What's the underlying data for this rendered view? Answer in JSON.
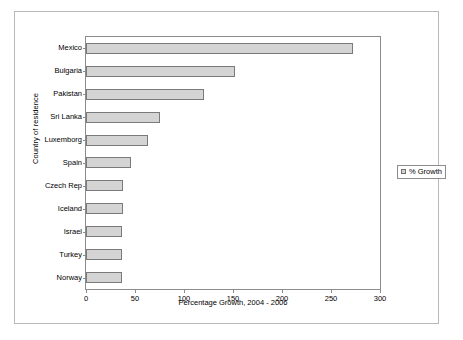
{
  "chart_data": {
    "type": "bar",
    "orientation": "horizontal",
    "title": "",
    "xlabel": "Percentage Growth, 2004 - 2006",
    "ylabel": "Country of residence",
    "xlim": [
      0,
      300
    ],
    "xticks": [
      0,
      50,
      100,
      150,
      200,
      250,
      300
    ],
    "grid": false,
    "legend_position": "right",
    "categories": [
      "Mexico",
      "Bulgaria",
      "Pakistan",
      "Sri Lanka",
      "Luxemborg",
      "Spain",
      "Czech Rep",
      "Iceland",
      "Israel",
      "Turkey",
      "Norway"
    ],
    "series": [
      {
        "name": "% Growth",
        "values": [
          272,
          152,
          120,
          76,
          63,
          46,
          38,
          38,
          37,
          37,
          37
        ]
      }
    ]
  },
  "legend": {
    "entries": [
      {
        "label": "% Growth",
        "color": "#d4d4d4"
      }
    ]
  },
  "style": {
    "bar_fill": "#d4d4d4",
    "bar_border": "#7a7a7a",
    "axis_color": "#8c8c8c",
    "frame_color": "#b9b9b9",
    "background": "#ffffff"
  }
}
